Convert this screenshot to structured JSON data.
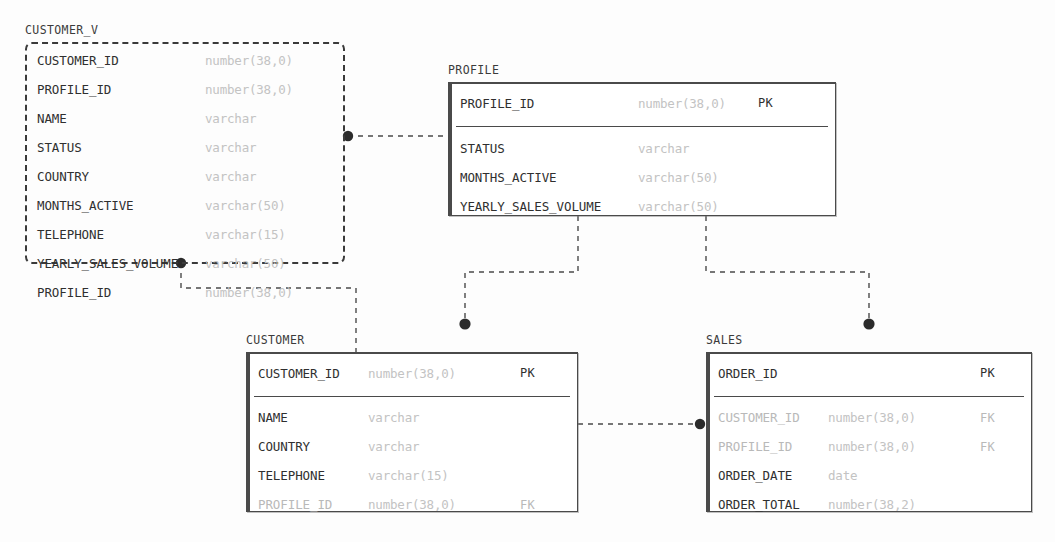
{
  "diagram": {
    "kind": "entity-relationship-diagram",
    "entities": [
      {
        "id": "customer_v",
        "title": "CUSTOMER_V",
        "style": "dashed",
        "has_pk_section": false,
        "fields": [
          {
            "name": "CUSTOMER_ID",
            "type": "number(38,0)",
            "key": "",
            "muted": false
          },
          {
            "name": "PROFILE_ID",
            "type": "number(38,0)",
            "key": "",
            "muted": false
          },
          {
            "name": "NAME",
            "type": "varchar",
            "key": "",
            "muted": false
          },
          {
            "name": "STATUS",
            "type": "varchar",
            "key": "",
            "muted": false
          },
          {
            "name": "COUNTRY",
            "type": "varchar",
            "key": "",
            "muted": false
          },
          {
            "name": "MONTHS_ACTIVE",
            "type": "varchar(50)",
            "key": "",
            "muted": false
          },
          {
            "name": "TELEPHONE",
            "type": "varchar(15)",
            "key": "",
            "muted": false
          },
          {
            "name": "YEARLY_SALES_VOLUME",
            "type": "varchar(50)",
            "key": "",
            "muted": false
          },
          {
            "name": "PROFILE_ID",
            "type": "number(38,0)",
            "key": "",
            "muted": false
          }
        ]
      },
      {
        "id": "profile",
        "title": "PROFILE",
        "style": "solid",
        "has_pk_section": true,
        "pk_fields": [
          {
            "name": "PROFILE_ID",
            "type": "number(38,0)",
            "key": "PK",
            "muted": false
          }
        ],
        "fields": [
          {
            "name": "STATUS",
            "type": "varchar",
            "key": "",
            "muted": false
          },
          {
            "name": "MONTHS_ACTIVE",
            "type": "varchar(50)",
            "key": "",
            "muted": false
          },
          {
            "name": "YEARLY_SALES_VOLUME",
            "type": "varchar(50)",
            "key": "",
            "muted": false
          }
        ]
      },
      {
        "id": "customer",
        "title": "CUSTOMER",
        "style": "solid",
        "has_pk_section": true,
        "pk_fields": [
          {
            "name": "CUSTOMER_ID",
            "type": "number(38,0)",
            "key": "PK",
            "muted": false
          }
        ],
        "fields": [
          {
            "name": "NAME",
            "type": "varchar",
            "key": "",
            "muted": false
          },
          {
            "name": "COUNTRY",
            "type": "varchar",
            "key": "",
            "muted": false
          },
          {
            "name": "TELEPHONE",
            "type": "varchar(15)",
            "key": "",
            "muted": false
          },
          {
            "name": "PROFILE_ID",
            "type": "number(38,0)",
            "key": "FK",
            "muted": true
          }
        ]
      },
      {
        "id": "sales",
        "title": "SALES",
        "style": "solid",
        "has_pk_section": true,
        "pk_fields": [
          {
            "name": "ORDER_ID",
            "type": "",
            "key": "PK",
            "muted": false
          }
        ],
        "fields": [
          {
            "name": "CUSTOMER_ID",
            "type": "number(38,0)",
            "key": "FK",
            "muted": true
          },
          {
            "name": "PROFILE_ID",
            "type": "number(38,0)",
            "key": "FK",
            "muted": true
          },
          {
            "name": "ORDER_DATE",
            "type": "date",
            "key": "",
            "muted": false
          },
          {
            "name": "ORDER_TOTAL",
            "type": "number(38,2)",
            "key": "",
            "muted": false
          }
        ]
      }
    ],
    "relationships": [
      {
        "id": "customer_v-to-profile",
        "from": "customer_v",
        "to": "profile",
        "endpoint_dot": "from"
      },
      {
        "id": "customer_v-to-customer",
        "from": "customer_v",
        "to": "customer",
        "endpoint_dot": "from"
      },
      {
        "id": "profile-to-customer",
        "from": "profile",
        "to": "customer",
        "endpoint_dot": "to"
      },
      {
        "id": "profile-to-sales",
        "from": "profile",
        "to": "sales",
        "endpoint_dot": "to"
      },
      {
        "id": "customer-to-sales",
        "from": "customer",
        "to": "sales",
        "endpoint_dot": "to"
      }
    ],
    "colors": {
      "line": "#4a4a4a",
      "dot": "#2b2b2b",
      "field_name": "#2f2f2f",
      "field_name_muted": "#b9b9b9",
      "field_type": "#c3c3c3",
      "box_border": "#4a4a4a",
      "background": "#fdfdfd"
    }
  }
}
